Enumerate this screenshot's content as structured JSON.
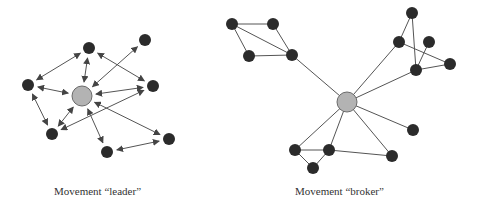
{
  "diagrams": [
    {
      "caption": "Movement “leader”",
      "center": {
        "x": 82,
        "y": 96
      },
      "nodes": [
        {
          "x": 89,
          "y": 48
        },
        {
          "x": 145,
          "y": 40
        },
        {
          "x": 28,
          "y": 85
        },
        {
          "x": 153,
          "y": 86
        },
        {
          "x": 52,
          "y": 134
        },
        {
          "x": 107,
          "y": 152
        },
        {
          "x": 169,
          "y": 139
        }
      ],
      "edges": [
        [
          0,
          -1
        ],
        [
          1,
          -1
        ],
        [
          2,
          -1
        ],
        [
          3,
          -1
        ],
        [
          4,
          -1
        ],
        [
          5,
          -1
        ],
        [
          6,
          -1
        ],
        [
          0,
          2
        ],
        [
          0,
          3
        ],
        [
          2,
          4
        ],
        [
          3,
          4
        ],
        [
          5,
          6
        ]
      ],
      "edge_type": "bidirectional-arrow"
    },
    {
      "caption": "Movement “broker”",
      "center": {
        "x": 347,
        "y": 102
      },
      "nodes": [
        {
          "x": 232,
          "y": 24
        },
        {
          "x": 273,
          "y": 24
        },
        {
          "x": 249,
          "y": 56
        },
        {
          "x": 292,
          "y": 55
        },
        {
          "x": 412,
          "y": 13
        },
        {
          "x": 399,
          "y": 42
        },
        {
          "x": 429,
          "y": 42
        },
        {
          "x": 450,
          "y": 64
        },
        {
          "x": 416,
          "y": 70
        },
        {
          "x": 413,
          "y": 130
        },
        {
          "x": 295,
          "y": 150
        },
        {
          "x": 329,
          "y": 150
        },
        {
          "x": 313,
          "y": 168
        },
        {
          "x": 392,
          "y": 156
        }
      ],
      "edges": [
        [
          0,
          1
        ],
        [
          0,
          2
        ],
        [
          0,
          3
        ],
        [
          1,
          3
        ],
        [
          2,
          3
        ],
        [
          3,
          -1
        ],
        [
          4,
          5
        ],
        [
          4,
          8
        ],
        [
          5,
          7
        ],
        [
          6,
          8
        ],
        [
          8,
          7
        ],
        [
          5,
          -1
        ],
        [
          8,
          -1
        ],
        [
          9,
          -1
        ],
        [
          10,
          -1
        ],
        [
          11,
          -1
        ],
        [
          13,
          -1
        ],
        [
          10,
          11
        ],
        [
          10,
          12
        ],
        [
          11,
          12
        ],
        [
          11,
          13
        ]
      ],
      "edge_type": "line"
    }
  ],
  "colors": {
    "node": "#2b2b2b",
    "center": "#b3b3b3",
    "center_stroke": "#6a6a6a",
    "edge": "#555555"
  }
}
